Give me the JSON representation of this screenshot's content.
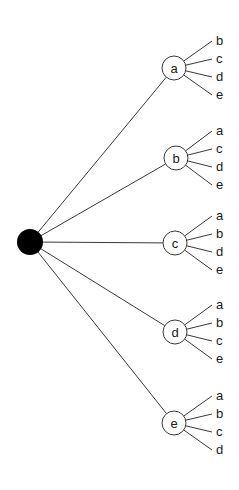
{
  "diagram": {
    "type": "tree",
    "root": {
      "label": "",
      "x": 30,
      "y": 242,
      "r": 13,
      "fill": "#000000"
    },
    "children": [
      {
        "label": "a",
        "x": 174,
        "y": 68,
        "r": 12,
        "leaves": [
          "b",
          "c",
          "d",
          "e"
        ]
      },
      {
        "label": "b",
        "x": 176,
        "y": 158,
        "r": 12,
        "leaves": [
          "a",
          "c",
          "d",
          "e"
        ]
      },
      {
        "label": "c",
        "x": 175,
        "y": 243,
        "r": 12,
        "leaves": [
          "a",
          "b",
          "d",
          "e"
        ]
      },
      {
        "label": "d",
        "x": 175,
        "y": 332,
        "r": 12,
        "leaves": [
          "a",
          "b",
          "c",
          "e"
        ]
      },
      {
        "label": "e",
        "x": 174,
        "y": 423,
        "r": 12,
        "leaves": [
          "a",
          "b",
          "c",
          "d"
        ]
      }
    ],
    "colors": {
      "edge": "#3a3a3a",
      "root": "#000000",
      "node_fill": "#ffffff",
      "text": "#1a1a1a"
    }
  }
}
